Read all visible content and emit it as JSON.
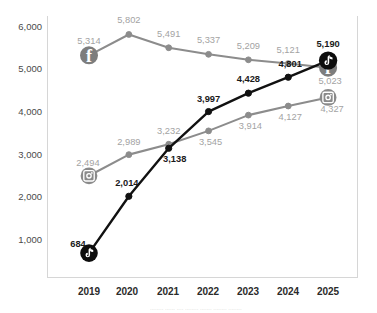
{
  "chart_data": {
    "type": "line",
    "title": "",
    "subtitle": "",
    "xlabel": "",
    "ylabel": "",
    "categories": [
      "2019",
      "2020",
      "2021",
      "2022",
      "2023",
      "2024",
      "2025"
    ],
    "ylim": [
      0,
      6400
    ],
    "yticks": [
      1000,
      2000,
      3000,
      4000,
      5000,
      6000
    ],
    "ytick_labels": [
      "1,000",
      "2,000",
      "3,000",
      "4,000",
      "5,000",
      "6,000"
    ],
    "grid": false,
    "legend_position": "none",
    "series": [
      {
        "name": "Facebook",
        "icon": "facebook-icon",
        "color": "#8c8c8c",
        "label_color": "#a3a3a3",
        "icon_at": [
          "2019",
          "2025"
        ],
        "values": [
          5314,
          5802,
          5491,
          5337,
          5209,
          5121,
          5023
        ],
        "value_labels": [
          "5,314",
          "5,802",
          "5,491",
          "5,337",
          "5,209",
          "5,121",
          "5,023"
        ]
      },
      {
        "name": "Instagram",
        "icon": "instagram-icon",
        "color": "#8c8c8c",
        "label_color": "#a3a3a3",
        "icon_at": [
          "2019",
          "2025"
        ],
        "values": [
          2494,
          2989,
          3232,
          3545,
          3914,
          4127,
          4327
        ],
        "value_labels": [
          "2,494",
          "2,989",
          "3,232",
          "3,545",
          "3,914",
          "4,127",
          "4,327"
        ]
      },
      {
        "name": "TikTok",
        "icon": "tiktok-icon",
        "color": "#111111",
        "label_color": "#1a1a1a",
        "icon_at": [
          "2019",
          "2025"
        ],
        "values": [
          684,
          2014,
          3138,
          3997,
          4428,
          4801,
          5190
        ],
        "value_labels": [
          "684",
          "2,014",
          "3,138",
          "3,997",
          "4,428",
          "4,801",
          "5,190"
        ]
      }
    ]
  },
  "axis": {
    "y_tick_labels": [
      "6,000",
      "5,000",
      "4,000",
      "3,000",
      "2,000",
      "1,000"
    ],
    "x_tick_labels": [
      "2019",
      "2020",
      "2021",
      "2022",
      "2023",
      "2024",
      "2025"
    ]
  },
  "footer": {
    "cropped_note": "........ ...... .... ........ ....... ........ ........"
  }
}
